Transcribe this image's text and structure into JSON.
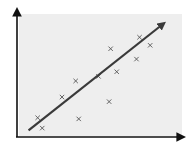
{
  "chart_data": {
    "type": "scatter",
    "title": "",
    "xlabel": "",
    "ylabel": "",
    "grid": false,
    "legend": null,
    "xlim": [
      0,
      10
    ],
    "ylim": [
      0,
      10
    ],
    "points": [
      {
        "x": 0.9,
        "y": 1.5
      },
      {
        "x": 1.2,
        "y": 0.6
      },
      {
        "x": 2.5,
        "y": 3.3
      },
      {
        "x": 3.4,
        "y": 4.7
      },
      {
        "x": 3.6,
        "y": 1.4
      },
      {
        "x": 4.9,
        "y": 5.1
      },
      {
        "x": 5.6,
        "y": 2.9
      },
      {
        "x": 5.7,
        "y": 7.5
      },
      {
        "x": 6.1,
        "y": 5.5
      },
      {
        "x": 7.4,
        "y": 6.6
      },
      {
        "x": 7.6,
        "y": 8.5
      },
      {
        "x": 8.3,
        "y": 7.8
      }
    ],
    "trend_line": {
      "x0": 0.3,
      "y0": 0.4,
      "x1": 9.0,
      "y1": 9.5,
      "arrow": true
    },
    "marker": "x",
    "colors": {
      "background": "#eeeeee",
      "axis": "#333333",
      "trend": "#3a3a3a",
      "marker": "#555555"
    }
  }
}
